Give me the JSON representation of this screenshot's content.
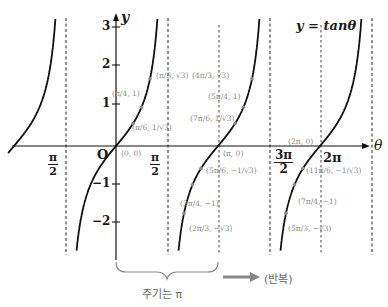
{
  "chart_data": {
    "type": "line",
    "title": "y = tanθ",
    "function": "tan",
    "xlabel": "θ",
    "ylabel": "y",
    "xlim_radians": [
      -2.25,
      8.2
    ],
    "ylim": [
      -2.7,
      3.2
    ],
    "grid": false,
    "x_tick_labels": [
      "π/2",
      "π/2",
      "3π/2",
      "2π"
    ],
    "y_ticks": [
      3,
      2,
      1,
      -1,
      -2
    ],
    "origin_label": "O",
    "asymptotes": [
      "-π/2",
      "π/2",
      "3π/2",
      "5π/2"
    ],
    "annotated_points": [
      {
        "label": "(0, 0)",
        "x": 0,
        "y": 0
      },
      {
        "label": "(π/6, 1/√3)",
        "x": 0.5236,
        "y": 0.5774
      },
      {
        "label": "(π/4, 1)",
        "x": 0.7854,
        "y": 1
      },
      {
        "label": "(π/3, √3)",
        "x": 1.0472,
        "y": 1.7321
      },
      {
        "label": "(2π/3, -√3)",
        "x": 2.0944,
        "y": -1.7321
      },
      {
        "label": "(3π/4, -1)",
        "x": 2.3562,
        "y": -1
      },
      {
        "label": "(5π/6, -1/√3)",
        "x": 2.618,
        "y": -0.5774
      },
      {
        "label": "(π, 0)",
        "x": 3.1416,
        "y": 0
      },
      {
        "label": "(7π/6, 1/√3)",
        "x": 3.6652,
        "y": 0.5774
      },
      {
        "label": "(5π/4, 1)",
        "x": 3.927,
        "y": 1
      },
      {
        "label": "(4π/3, √3)",
        "x": 4.1888,
        "y": 1.7321
      },
      {
        "label": "(5π/3, -√3)",
        "x": 5.236,
        "y": -1.7321
      },
      {
        "label": "(7π/4, -1)",
        "x": 5.4978,
        "y": -1
      },
      {
        "label": "(11π/6, -1/√3)",
        "x": 5.7596,
        "y": -0.5774
      },
      {
        "label": "(2π, 0)",
        "x": 6.2832,
        "y": 0
      }
    ],
    "annotations": [
      "주기는 π",
      "(반복)"
    ]
  },
  "labels": {
    "equation": "y = tanθ",
    "x_axis": "θ",
    "y_axis": "y",
    "origin": "O",
    "period_caption": "주기는 π",
    "repeat_caption": "(반복)",
    "ticks": {
      "x": [
        {
          "num": "π",
          "den": "2"
        },
        {
          "num": "π",
          "den": "2"
        },
        {
          "num": "3π",
          "den": "2"
        },
        {
          "text": "2π"
        }
      ],
      "y": [
        "3",
        "2",
        "1",
        "−1",
        "−2"
      ]
    },
    "points": {
      "p0": "(0, 0)",
      "p_pi6": "(π/6, 1/√3)",
      "p_pi4": "(π/4, 1)",
      "p_pi3": "(π/3, √3)",
      "p_2pi3": "(2π/3, −√3)",
      "p_3pi4": "(3π/4, −1)",
      "p_5pi6": "(5π/6, −1/√3)",
      "p_pi": "(π, 0)",
      "p_7pi6": "(7π/6, 1/√3)",
      "p_5pi4": "(5π/4, 1)",
      "p_4pi3": "(4π/3, √3)",
      "p_5pi3": "(5π/3, −√3)",
      "p_7pi4": "(7π/4, −1)",
      "p_11pi6": "(11π/6, −1/√3)",
      "p_2pi": "(2π, 0)"
    }
  }
}
